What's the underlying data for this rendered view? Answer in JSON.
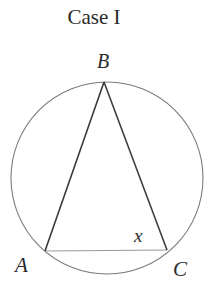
{
  "title": "Case I",
  "diagram": {
    "type": "inscribed-triangle-in-circle",
    "circle": {
      "cx": 107,
      "cy": 178,
      "r": 96,
      "stroke": "#7a7a7a"
    },
    "vertices": {
      "A": {
        "x": 45,
        "y": 251,
        "label": "A"
      },
      "B": {
        "x": 104,
        "y": 82,
        "label": "B"
      },
      "C": {
        "x": 167,
        "y": 250,
        "label": "C"
      }
    },
    "angle_label": {
      "text": "x",
      "at_vertex": "C"
    },
    "edges": [
      {
        "from": "A",
        "to": "B",
        "stroke": "#3a3a3a"
      },
      {
        "from": "B",
        "to": "C",
        "stroke": "#3a3a3a"
      },
      {
        "from": "A",
        "to": "C",
        "stroke": "#9a9a9a"
      }
    ]
  },
  "labels": {
    "A": "A",
    "B": "B",
    "C": "C",
    "x": "x"
  }
}
